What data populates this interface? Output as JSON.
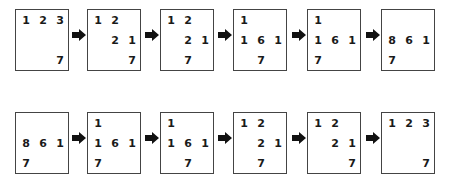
{
  "diagram": {
    "arrow_icon": "right-arrow",
    "rows": [
      {
        "boxes": [
          {
            "cells": [
              [
                "1",
                "2",
                "3"
              ],
              [
                "",
                "",
                ""
              ],
              [
                "",
                "",
                "7"
              ]
            ]
          },
          {
            "cells": [
              [
                "1",
                "2",
                ""
              ],
              [
                "",
                "2",
                "1"
              ],
              [
                "",
                "",
                "7"
              ]
            ]
          },
          {
            "cells": [
              [
                "1",
                "2",
                ""
              ],
              [
                "",
                "2",
                "1"
              ],
              [
                "",
                "7",
                ""
              ]
            ]
          },
          {
            "cells": [
              [
                "1",
                "",
                ""
              ],
              [
                "1",
                "6",
                "1"
              ],
              [
                "",
                "7",
                ""
              ]
            ]
          },
          {
            "cells": [
              [
                "1",
                "",
                ""
              ],
              [
                "1",
                "6",
                "1"
              ],
              [
                "7",
                "",
                ""
              ]
            ]
          },
          {
            "cells": [
              [
                "",
                "",
                ""
              ],
              [
                "8",
                "6",
                "1"
              ],
              [
                "7",
                "",
                ""
              ]
            ]
          }
        ]
      },
      {
        "boxes": [
          {
            "cells": [
              [
                "",
                "",
                ""
              ],
              [
                "8",
                "6",
                "1"
              ],
              [
                "7",
                "",
                ""
              ]
            ]
          },
          {
            "cells": [
              [
                "1",
                "",
                ""
              ],
              [
                "1",
                "6",
                "1"
              ],
              [
                "7",
                "",
                ""
              ]
            ]
          },
          {
            "cells": [
              [
                "1",
                "",
                ""
              ],
              [
                "1",
                "6",
                "1"
              ],
              [
                "",
                "7",
                ""
              ]
            ]
          },
          {
            "cells": [
              [
                "1",
                "2",
                ""
              ],
              [
                "",
                "2",
                "1"
              ],
              [
                "",
                "7",
                ""
              ]
            ]
          },
          {
            "cells": [
              [
                "1",
                "2",
                ""
              ],
              [
                "",
                "2",
                "1"
              ],
              [
                "",
                "",
                "7"
              ]
            ]
          },
          {
            "cells": [
              [
                "1",
                "2",
                "3"
              ],
              [
                "",
                "",
                ""
              ],
              [
                "",
                "",
                "7"
              ]
            ]
          }
        ]
      }
    ]
  }
}
